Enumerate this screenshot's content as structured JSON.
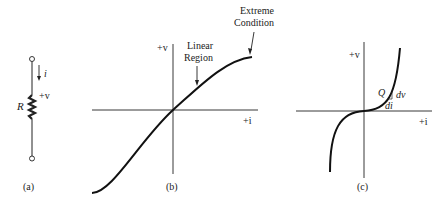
{
  "panels": {
    "a": {
      "caption": "(a)",
      "resistor_label": "R",
      "current_label": "i",
      "voltage_label": "+v"
    },
    "b": {
      "caption": "(b)",
      "y_axis_label": "+v",
      "x_axis_label": "+i",
      "annotation_linear_line1": "Linear",
      "annotation_linear_line2": "Region",
      "annotation_extreme_line1": "Extreme",
      "annotation_extreme_line2": "Condition"
    },
    "c": {
      "caption": "(c)",
      "y_axis_label": "+v",
      "x_axis_label": "+i",
      "point_label": "Q",
      "dv_label": "dv",
      "di_label": "di"
    }
  },
  "colors": {
    "ink": "#222222",
    "background": "#ffffff"
  }
}
